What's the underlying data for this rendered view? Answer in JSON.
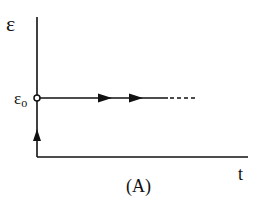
{
  "diagram": {
    "y_axis_label": "ε",
    "x_axis_label": "t",
    "initial_value_label": "ε",
    "initial_value_subscript": "o",
    "caption": "(A)",
    "colors": {
      "line": "#111111",
      "background": "#ffffff"
    }
  }
}
